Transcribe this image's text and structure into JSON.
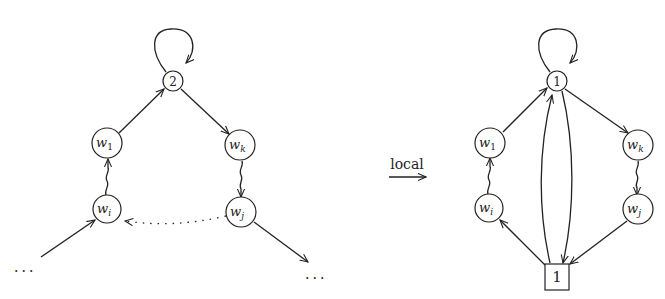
{
  "left_graph": {
    "top_node": "2",
    "w1": {
      "base": "w",
      "sub": "1"
    },
    "wk": {
      "base": "w",
      "sub": "k"
    },
    "wi": {
      "base": "w",
      "sub": "i"
    },
    "wj": {
      "base": "w",
      "sub": "j"
    },
    "ellipsis_left": "...",
    "ellipsis_right": "..."
  },
  "transform": {
    "label": "local"
  },
  "right_graph": {
    "top_node": "1",
    "w1": {
      "base": "w",
      "sub": "1"
    },
    "wk": {
      "base": "w",
      "sub": "k"
    },
    "wi": {
      "base": "w",
      "sub": "i"
    },
    "wj": {
      "base": "w",
      "sub": "j"
    },
    "box_node": "1"
  },
  "colors": {
    "stroke": "#222222",
    "background": "#ffffff"
  }
}
